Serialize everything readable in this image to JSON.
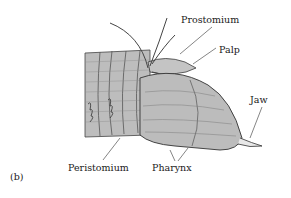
{
  "figure": {
    "panel_label": "(b)",
    "labels": {
      "prostomium": "Prostomium",
      "palp": "Palp",
      "jaw": "Jaw",
      "peristomium": "Peristomium",
      "pharynx": "Pharynx"
    },
    "colors": {
      "body_fill": "#b9b9b9",
      "body_light": "#cfcfcf",
      "outline": "#3a3a3a",
      "text": "#1a1a1a",
      "background": "#ffffff"
    }
  }
}
